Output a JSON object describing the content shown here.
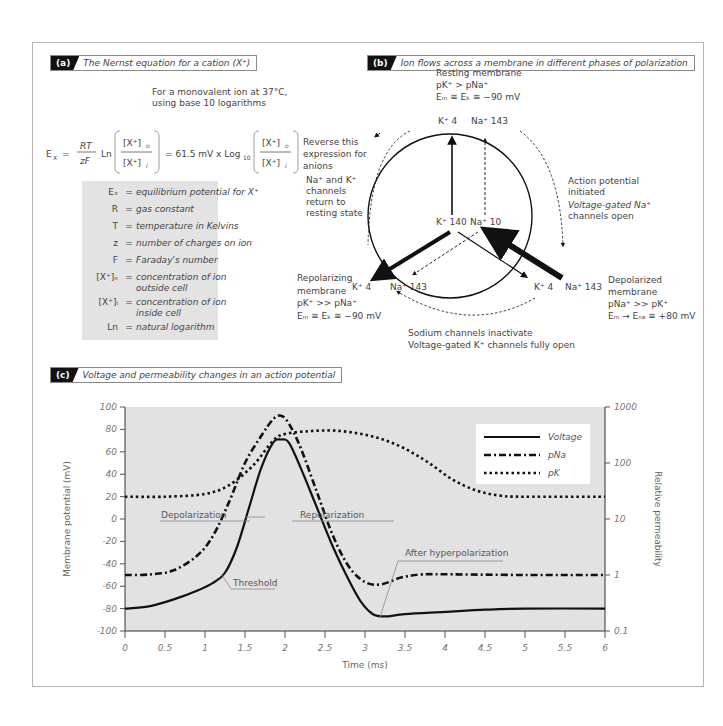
{
  "panels": {
    "a": {
      "tag": "(a)",
      "title": "The Nernst equation for a cation (X⁺)",
      "note_line1": "For a monovalent ion at 37°C,",
      "note_line2": "using base 10 logarithms",
      "equation": {
        "lhs": "E",
        "lhs_sub": "X",
        "equals": "=",
        "frac_num": "RT",
        "frac_den": "zF",
        "ln": "Ln",
        "conc_out": "[X⁺]",
        "conc_out_sub": "o",
        "conc_in": "[X⁺]",
        "conc_in_sub": "i",
        "middle": "= 61.5 mV x Log",
        "log_base": "10",
        "reverse_line1": "Reverse this",
        "reverse_line2": "expression for",
        "reverse_line3": "anions"
      },
      "legend": [
        {
          "symbol": "Eₓ",
          "def": "equilibrium potential for X⁺",
          "def2": ""
        },
        {
          "symbol": "R",
          "def": "gas constant",
          "def2": ""
        },
        {
          "symbol": "T",
          "def": "temperature in Kelvins",
          "def2": ""
        },
        {
          "symbol": "z",
          "def": "number of charges on ion",
          "def2": ""
        },
        {
          "symbol": "F",
          "def": "Faraday's number",
          "def2": ""
        },
        {
          "symbol": "[X⁺]ₒ",
          "def": "concentration of ion",
          "def2": "outside cell"
        },
        {
          "symbol": "[X⁺]ᵢ",
          "def": "concentration of ion",
          "def2": "inside cell"
        },
        {
          "symbol": "Ln",
          "def": "natural logarithm",
          "def2": ""
        }
      ]
    },
    "b": {
      "tag": "(b)",
      "title": "Ion flows across a membrane in different phases of polarization",
      "resting": {
        "l1": "Resting membrane",
        "l2": "pK⁺ > pNa⁺",
        "l3": "Eₘ ≅ Eₖ ≅ −90 mV",
        "k": "K⁺  4",
        "na": "Na⁺  143"
      },
      "inside": {
        "k": "K⁺  140",
        "na": "Na⁺  10"
      },
      "initiated": {
        "l1": "Action potential",
        "l2": "initiated",
        "l3": "Voltage-gated Na⁺",
        "l4": "channels open"
      },
      "depolarized": {
        "k": "K⁺  4",
        "na": "Na⁺  143",
        "l1": "Depolarized",
        "l2": "membrane",
        "l3": "pNa⁺ >> pK⁺",
        "l4": "Eₘ → Eₙₐ ≅ +80 mV"
      },
      "repolarizing": {
        "k": "K⁺  4",
        "na": "Na⁺  143",
        "l1": "Repolarizing",
        "l2": "membrane",
        "l3": "pK⁺ >> pNa⁺",
        "l4": "Eₘ ≅ Eₖ ≅ −90 mV"
      },
      "return": {
        "l1": "Na⁺ and K⁺",
        "l2": "channels",
        "l3": "return to",
        "l4": "resting state"
      },
      "inactivate": {
        "l1": "Sodium channels inactivate",
        "l2": "Voltage-gated K⁺ channels fully open"
      }
    },
    "c": {
      "tag": "(c)",
      "title": "Voltage and permeability changes in an action potential"
    }
  },
  "chart_data": {
    "type": "line",
    "title": "Voltage and permeability changes in an action potential",
    "xlabel": "Time (ms)",
    "ylabel": "Membrane potential (mV)",
    "y2label": "Relative permeability",
    "xlim": [
      0,
      6
    ],
    "ylim": [
      -100,
      100
    ],
    "y2lim": [
      0.1,
      1000
    ],
    "y2scale": "log",
    "xticks": [
      "0",
      "0.5",
      "1",
      "1.5",
      "2",
      "2.5",
      "3",
      "3.5",
      "4",
      "4.5",
      "5",
      "5.5",
      "6"
    ],
    "yticks": [
      "100",
      "80",
      "60",
      "40",
      "20",
      "0",
      "-20",
      "-40",
      "-60",
      "-80",
      "-100"
    ],
    "y2ticks": [
      "1000",
      "100",
      "10",
      "1",
      "0.1"
    ],
    "grid": false,
    "legend_position": "upper right",
    "background": "#e2e2e2",
    "series": [
      {
        "name": "Voltage",
        "axis": "left",
        "style": "solid",
        "x": [
          0,
          0.3,
          0.6,
          0.9,
          1.1,
          1.25,
          1.4,
          1.55,
          1.7,
          1.85,
          1.95,
          2.05,
          2.2,
          2.4,
          2.6,
          2.8,
          2.95,
          3.1,
          3.25,
          3.5,
          4.0,
          4.5,
          5.0,
          6.0
        ],
        "y": [
          -80,
          -78,
          -72,
          -64,
          -57,
          -48,
          -25,
          10,
          45,
          68,
          71,
          68,
          45,
          10,
          -25,
          -55,
          -74,
          -85,
          -87,
          -85,
          -83,
          -81,
          -80,
          -80
        ]
      },
      {
        "name": "pNa",
        "axis": "right",
        "style": "dash-dot",
        "x": [
          0,
          0.3,
          0.6,
          0.9,
          1.1,
          1.3,
          1.5,
          1.7,
          1.85,
          1.95,
          2.05,
          2.2,
          2.4,
          2.6,
          2.8,
          3.0,
          3.2,
          3.45,
          3.7,
          4.0,
          5.0,
          6.0
        ],
        "y": [
          1,
          1.02,
          1.2,
          2.2,
          5,
          20,
          100,
          300,
          600,
          700,
          500,
          180,
          30,
          5,
          1.4,
          0.75,
          0.68,
          0.9,
          1.02,
          1.03,
          1.0,
          1.0
        ]
      },
      {
        "name": "pK",
        "axis": "right",
        "style": "dotted",
        "x": [
          0,
          0.5,
          1.0,
          1.3,
          1.6,
          1.85,
          2.0,
          2.3,
          2.6,
          2.9,
          3.2,
          3.5,
          3.8,
          4.1,
          4.4,
          4.7,
          5.0,
          6.0
        ],
        "y": [
          25,
          25,
          28,
          40,
          90,
          250,
          330,
          370,
          380,
          340,
          270,
          180,
          100,
          50,
          32,
          26,
          25,
          25
        ]
      }
    ],
    "annotations": [
      {
        "text": "Depolarization",
        "x": 0.45,
        "y": 5
      },
      {
        "text": "Repolarization",
        "x": 2.6,
        "y": 5
      },
      {
        "text": "Threshold",
        "x": 1.35,
        "y": -63
      },
      {
        "text": "After hyperpolarization",
        "x": 3.4,
        "y": -54
      }
    ]
  }
}
